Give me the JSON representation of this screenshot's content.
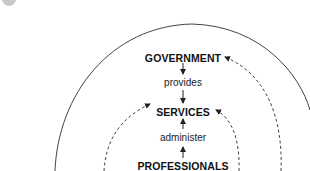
{
  "caption": {
    "text": "",
    "bullet_color": "#c8c8c8"
  },
  "diagram": {
    "nodes": {
      "government": "GOVERNMENT",
      "services": "SERVICES",
      "professionals": "PROFESSIONALS"
    },
    "edges": {
      "government_to_services": "provides",
      "professionals_to_services": "administer"
    },
    "arcs": [
      {
        "name": "outer-arc",
        "style": "solid"
      },
      {
        "name": "middle-arc",
        "style": "dashed",
        "arrow_target": "GOVERNMENT"
      },
      {
        "name": "inner-arc",
        "style": "dashed",
        "arrow_target": "SERVICES"
      }
    ],
    "line_color": "#333333"
  }
}
